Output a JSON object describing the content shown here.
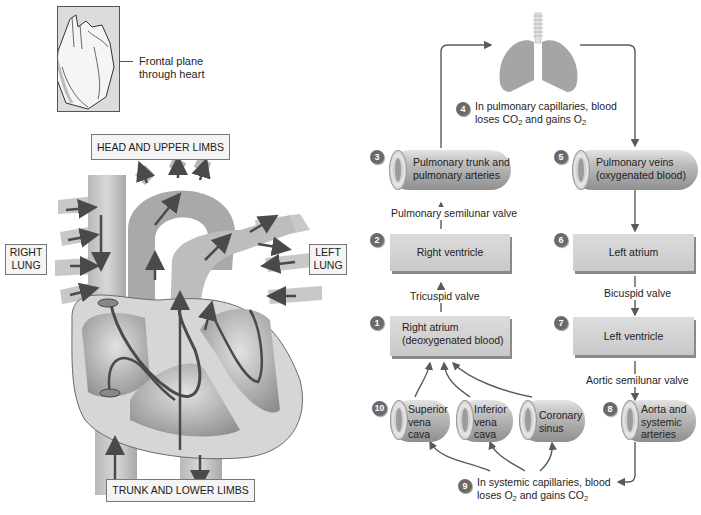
{
  "inset": {
    "caption_line1": "Frontal plane",
    "caption_line2": "through heart"
  },
  "heart_labels": {
    "head": "HEAD AND UPPER LIMBS",
    "right_lung_1": "RIGHT",
    "right_lung_2": "LUNG",
    "left_lung_1": "LEFT",
    "left_lung_2": "LUNG",
    "trunk": "TRUNK AND LOWER LIMBS"
  },
  "flow": {
    "step1": {
      "num": "1",
      "line1": "Right atrium",
      "line2": "(deoxygenated blood)"
    },
    "step2": {
      "num": "2",
      "label": "Right ventricle"
    },
    "step3": {
      "num": "3",
      "line1": "Pulmonary trunk and",
      "line2": "pulmonary arteries"
    },
    "step4": {
      "num": "4",
      "line1": "In pulmonary capillaries, blood",
      "line2_a": "loses CO",
      "line2_sub1": "2",
      "line2_b": " and gains O",
      "line2_sub2": "2"
    },
    "step5": {
      "num": "5",
      "line1": "Pulmonary veins",
      "line2": "(oxygenated blood)"
    },
    "step6": {
      "num": "6",
      "label": "Left atrium"
    },
    "step7": {
      "num": "7",
      "label": "Left ventricle"
    },
    "step8": {
      "num": "8",
      "line1": "Aorta and",
      "line2": "systemic",
      "line3": "arteries"
    },
    "step9": {
      "num": "9",
      "line1": "In systemic capillaries, blood",
      "line2_a": "loses O",
      "line2_sub1": "2",
      "line2_b": " and gains CO",
      "line2_sub2": "2"
    },
    "step10": {
      "num": "10"
    },
    "svc": {
      "line1": "Superior",
      "line2": "vena",
      "line3": "cava"
    },
    "ivc": {
      "line1": "Inferior",
      "line2": "vena",
      "line3": "cava"
    },
    "cs": {
      "line1": "Coronary",
      "line2": "sinus"
    },
    "valves": {
      "pulmonary": "Pulmonary semilunar valve",
      "tricuspid": "Tricuspid valve",
      "bicuspid": "Bicuspid valve",
      "aortic": "Aortic semilunar valve"
    }
  },
  "colors": {
    "arrow": "#5a5a5a",
    "box": "#d2d2d2",
    "badge": "#6a6a6a"
  }
}
